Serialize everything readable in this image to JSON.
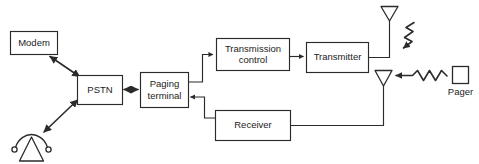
{
  "diagram": {
    "line_color": "#2b2b2b",
    "fill_color": "#ffffff",
    "background": "#ffffff",
    "boxes": [
      {
        "id": "modem",
        "label": "Modem",
        "label_line1": "Modem",
        "label_line2": "",
        "x": 10,
        "y": 31,
        "w": 47,
        "h": 23
      },
      {
        "id": "pstn",
        "label": "PSTN",
        "label_line1": "PSTN",
        "label_line2": "",
        "x": 77,
        "y": 75,
        "w": 45,
        "h": 29
      },
      {
        "id": "paging-terminal",
        "label": "Paging terminal",
        "label_line1": "Paging",
        "label_line2": "terminal",
        "x": 140,
        "y": 72,
        "w": 48,
        "h": 35
      },
      {
        "id": "transmission-control",
        "label": "Transmission control",
        "label_line1": "Transmission",
        "label_line2": "control",
        "x": 216,
        "y": 38,
        "w": 73,
        "h": 32
      },
      {
        "id": "transmitter",
        "label": "Transmitter",
        "label_line1": "Transmitter",
        "label_line2": "",
        "x": 306,
        "y": 42,
        "w": 62,
        "h": 30
      },
      {
        "id": "receiver",
        "label": "Receiver",
        "label_line1": "Receiver",
        "label_line2": "",
        "x": 215,
        "y": 110,
        "w": 75,
        "h": 30
      }
    ],
    "symbols": [
      {
        "id": "telephone",
        "name": "telephone-symbol",
        "label": ""
      },
      {
        "id": "antenna-transmit",
        "name": "transmit-antenna",
        "label": ""
      },
      {
        "id": "antenna-receive",
        "name": "receive-antenna",
        "label": ""
      },
      {
        "id": "pager",
        "name": "pager-device",
        "label": "Pager"
      },
      {
        "id": "rf-down",
        "name": "rf-signal-downlink",
        "label": ""
      },
      {
        "id": "rf-up",
        "name": "rf-signal-uplink",
        "label": ""
      }
    ],
    "labels": {
      "pager": "Pager"
    },
    "connections": [
      {
        "id": "modem-pstn",
        "from": "modem",
        "to": "pstn",
        "arrows": "both"
      },
      {
        "id": "telephone-pstn",
        "from": "telephone",
        "to": "pstn",
        "arrows": "both"
      },
      {
        "id": "pstn-paging",
        "from": "pstn",
        "to": "paging-terminal",
        "arrows": "both"
      },
      {
        "id": "paging-transmission",
        "from": "paging-terminal",
        "to": "transmission-control",
        "arrows": "end"
      },
      {
        "id": "transmission-transmit",
        "from": "transmission-control",
        "to": "transmitter",
        "arrows": "end"
      },
      {
        "id": "transmitter-antenna",
        "from": "transmitter",
        "to": "antenna-transmit",
        "arrows": "none"
      },
      {
        "id": "antenna-receiver",
        "from": "antenna-receive",
        "to": "receiver",
        "arrows": "none"
      },
      {
        "id": "receiver-paging",
        "from": "receiver",
        "to": "paging-terminal",
        "arrows": "end"
      },
      {
        "id": "antenna-pager",
        "from": "antenna-transmit",
        "to": "pager",
        "arrows": "end"
      },
      {
        "id": "pager-antenna",
        "from": "pager",
        "to": "antenna-receive",
        "arrows": "end"
      }
    ]
  }
}
